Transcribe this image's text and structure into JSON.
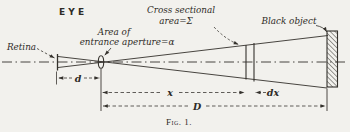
{
  "figure": {
    "eye_label": "EYE",
    "caption": "Fig. 1.",
    "labels": {
      "retina": "Retina",
      "aperture_line1": "Area of",
      "aperture_line2": "entrance aperture=α",
      "cross_section_line1": "Cross sectional",
      "cross_section_line2": "area=Σ",
      "black_object": "Black object"
    },
    "dimensions": {
      "d": "d",
      "x": "x",
      "dx": "dx",
      "D": "D"
    },
    "colors": {
      "ink": "#34312c",
      "paper": "#f2f1ed"
    }
  }
}
